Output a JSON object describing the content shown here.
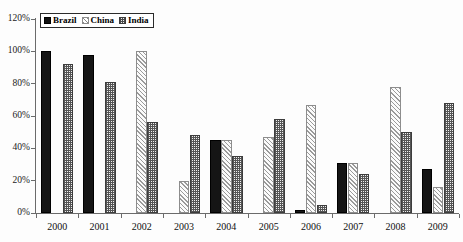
{
  "chart_data": {
    "type": "bar",
    "title": "",
    "subtitle": "",
    "xlabel": "",
    "ylabel": "",
    "categories": [
      "2000",
      "2001",
      "2002",
      "2003",
      "2004",
      "2005",
      "2006",
      "2007",
      "2008",
      "2009"
    ],
    "series": [
      {
        "name": "Brazil",
        "values": [
          100,
          98,
          0,
          0,
          45,
          0,
          2,
          31,
          0,
          27
        ]
      },
      {
        "name": "China",
        "values": [
          0,
          0,
          100,
          20,
          45,
          47,
          67,
          31,
          78,
          16
        ]
      },
      {
        "name": "India",
        "values": [
          92,
          81,
          56,
          48,
          35,
          58,
          5,
          24,
          50,
          68
        ]
      }
    ],
    "ylim": [
      0,
      120
    ],
    "ytick_values": [
      0,
      20,
      40,
      60,
      80,
      100,
      120
    ],
    "ytick_labels": [
      "0%",
      "20%",
      "40%",
      "60%",
      "80%",
      "100%",
      "120%"
    ],
    "grid": false,
    "legend_position": "top-left",
    "legend": [
      {
        "label": "Brazil",
        "pattern": "solid-black",
        "color": "#111111"
      },
      {
        "label": "China",
        "pattern": "diagonal-hatch-light",
        "color": "#9a9a9a"
      },
      {
        "label": "India",
        "pattern": "checkerboard-dark",
        "color": "#555555"
      }
    ],
    "background_color": "#fdfdfd",
    "axis_color": "#6b6b6b"
  }
}
